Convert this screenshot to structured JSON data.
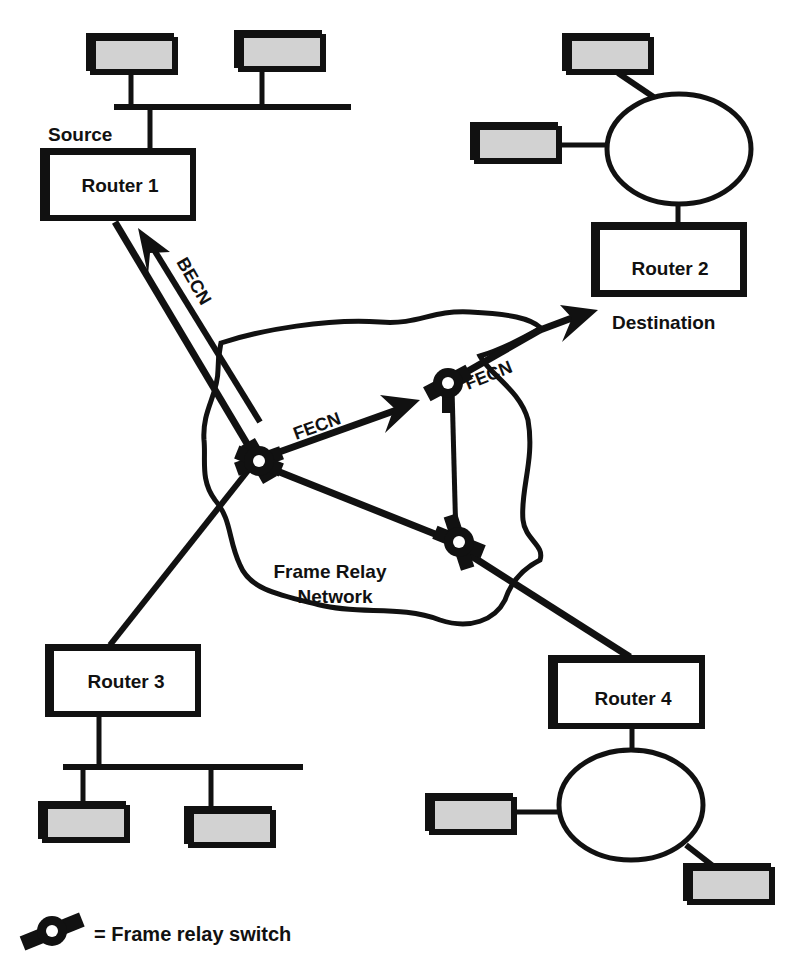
{
  "diagram": {
    "type": "network-topology",
    "title": "",
    "colors": {
      "line": "#111111",
      "workstation_fill": "#d2d2d2",
      "background": "#ffffff"
    },
    "routers": [
      {
        "id": "router-1",
        "label": "Router 1",
        "role_label": "Source"
      },
      {
        "id": "router-2",
        "label": "Router 2",
        "role_label": "Destination"
      },
      {
        "id": "router-3",
        "label": "Router 3",
        "role_label": ""
      },
      {
        "id": "router-4",
        "label": "Router 4",
        "role_label": ""
      }
    ],
    "network": {
      "label_line1": "Frame Relay",
      "label_line2": "Network"
    },
    "arrows": {
      "becn": "BECN",
      "fecn_1": "FECN",
      "fecn_2": "FECN"
    },
    "legend": {
      "icon": "frame-relay-switch-icon",
      "text": "= Frame relay switch"
    },
    "lans": [
      {
        "router": "router-1",
        "topology": "bus",
        "workstations": 2
      },
      {
        "router": "router-2",
        "topology": "ring",
        "workstations": 2
      },
      {
        "router": "router-3",
        "topology": "bus",
        "workstations": 2
      },
      {
        "router": "router-4",
        "topology": "ring",
        "workstations": 2
      }
    ],
    "switches": 3
  }
}
